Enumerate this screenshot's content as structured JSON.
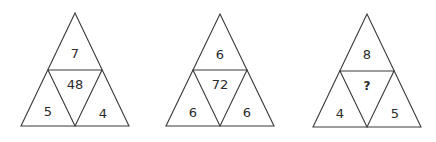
{
  "puzzle": {
    "triangles": [
      {
        "top": "7",
        "center": "48",
        "left": "5",
        "right": "4"
      },
      {
        "top": "6",
        "center": "72",
        "left": "6",
        "right": "6"
      },
      {
        "top": "8",
        "center": "?",
        "left": "4",
        "right": "5"
      }
    ]
  },
  "colors": {
    "stroke": "#3a3a3a",
    "text": "#2b2b2b",
    "background": "#ffffff"
  }
}
